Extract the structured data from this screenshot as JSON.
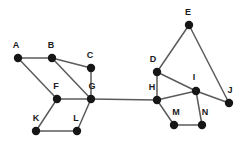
{
  "figure": {
    "title": "",
    "type": "undirected-graph",
    "width": 248,
    "height": 151,
    "background_color": "#ffffff",
    "node_color": "#161616",
    "edge_color": "#5b5b5b",
    "label_color": "#1a1a1a",
    "node_radius": 4.2,
    "edge_width": 1.5
  },
  "graph": {
    "node_count": 14,
    "edge_count": 18,
    "nodes": [
      {
        "id": "A",
        "label": "A",
        "x": 18,
        "y": 58,
        "label_x": 16,
        "label_y": 50
      },
      {
        "id": "B",
        "label": "B",
        "x": 52,
        "y": 58,
        "label_x": 51,
        "label_y": 50
      },
      {
        "id": "C",
        "label": "C",
        "x": 91,
        "y": 68,
        "label_x": 90,
        "label_y": 60
      },
      {
        "id": "D",
        "label": "D",
        "x": 157,
        "y": 72,
        "label_x": 153,
        "label_y": 64
      },
      {
        "id": "E",
        "label": "E",
        "x": 189,
        "y": 25,
        "label_x": 188,
        "label_y": 17
      },
      {
        "id": "F",
        "label": "F",
        "x": 57,
        "y": 99,
        "label_x": 56,
        "label_y": 91
      },
      {
        "id": "G",
        "label": "G",
        "x": 91,
        "y": 99,
        "label_x": 92,
        "label_y": 91
      },
      {
        "id": "H",
        "label": "H",
        "x": 157,
        "y": 100,
        "label_x": 152,
        "label_y": 92
      },
      {
        "id": "I",
        "label": "I",
        "x": 196,
        "y": 91,
        "label_x": 194,
        "label_y": 82
      },
      {
        "id": "J",
        "label": "J",
        "x": 229,
        "y": 103,
        "label_x": 230,
        "label_y": 95
      },
      {
        "id": "K",
        "label": "K",
        "x": 36,
        "y": 131,
        "label_x": 36,
        "label_y": 123
      },
      {
        "id": "L",
        "label": "L",
        "x": 77,
        "y": 131,
        "label_x": 76,
        "label_y": 123
      },
      {
        "id": "M",
        "label": "M",
        "x": 174,
        "y": 125,
        "label_x": 176,
        "label_y": 117
      },
      {
        "id": "N",
        "label": "N",
        "x": 202,
        "y": 125,
        "label_x": 205,
        "label_y": 117
      }
    ],
    "edges": [
      {
        "from": "A",
        "to": "B"
      },
      {
        "from": "A",
        "to": "F"
      },
      {
        "from": "B",
        "to": "C"
      },
      {
        "from": "B",
        "to": "G"
      },
      {
        "from": "C",
        "to": "G"
      },
      {
        "from": "F",
        "to": "G"
      },
      {
        "from": "F",
        "to": "K"
      },
      {
        "from": "K",
        "to": "L"
      },
      {
        "from": "L",
        "to": "G"
      },
      {
        "from": "G",
        "to": "H"
      },
      {
        "from": "H",
        "to": "D"
      },
      {
        "from": "H",
        "to": "I"
      },
      {
        "from": "H",
        "to": "M"
      },
      {
        "from": "D",
        "to": "E"
      },
      {
        "from": "D",
        "to": "I"
      },
      {
        "from": "E",
        "to": "J"
      },
      {
        "from": "I",
        "to": "J"
      },
      {
        "from": "I",
        "to": "N"
      },
      {
        "from": "M",
        "to": "N"
      }
    ]
  }
}
